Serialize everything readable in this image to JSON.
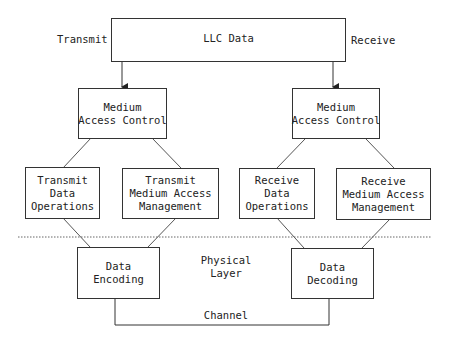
{
  "diagram": {
    "top": {
      "lines": [
        "LLC Data"
      ]
    },
    "side_labels": {
      "transmit": "Transmit",
      "receive": "Receive"
    },
    "transmit": {
      "mac": {
        "lines": [
          "Medium",
          "Access Control"
        ]
      },
      "data_ops": {
        "lines": [
          "Transmit",
          "Data",
          "Operations"
        ]
      },
      "mam": {
        "lines": [
          "Transmit",
          "Medium Access",
          "Management"
        ]
      },
      "coding": {
        "lines": [
          "Data",
          "Encoding"
        ]
      }
    },
    "receive": {
      "mac": {
        "lines": [
          "Medium",
          "Access Control"
        ]
      },
      "data_ops": {
        "lines": [
          "Receive",
          "Data",
          "Operations"
        ]
      },
      "mam": {
        "lines": [
          "Receive",
          "Medium Access",
          "Management"
        ]
      },
      "coding": {
        "lines": [
          "Data",
          "Decoding"
        ]
      }
    },
    "physical_layer": {
      "lines": [
        "Physical",
        "Layer"
      ]
    },
    "channel": "Channel",
    "colors": {
      "line": "#333333",
      "dotted": "#555555"
    }
  }
}
